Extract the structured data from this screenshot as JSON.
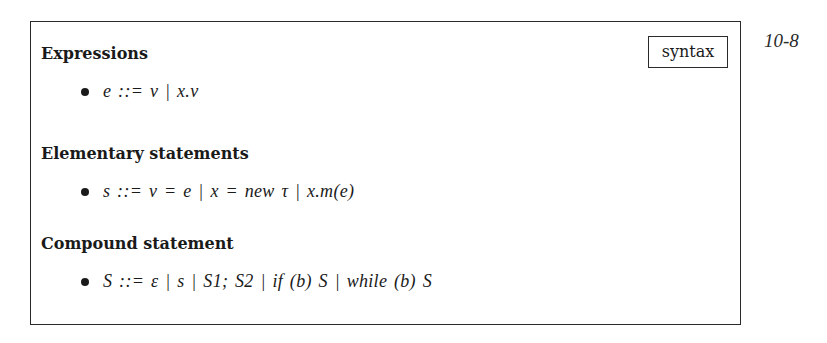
{
  "page": {
    "number": "10-8",
    "tag": "syntax"
  },
  "sections": [
    {
      "heading": "Expressions",
      "rule": "e ::= v  |  x.v"
    },
    {
      "heading": "Elementary statements",
      "rule": "s ::= v = e  |  x = new τ  |  x.m(e)"
    },
    {
      "heading": "Compound statement",
      "rule": "S ::= ε  |  s  |  S1;  S2  |  if (b) S  |  while (b) S"
    }
  ]
}
